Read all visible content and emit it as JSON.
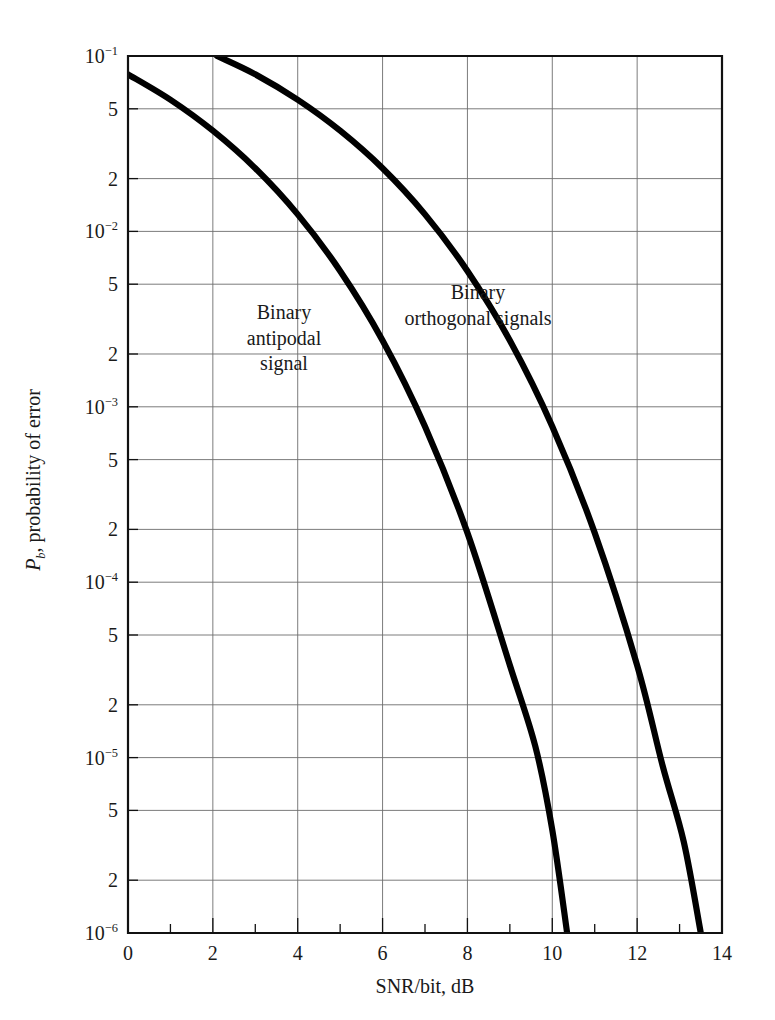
{
  "figure": {
    "background": "#ffffff",
    "curve_color": "#000000",
    "grid_color": "#6d6d6d",
    "axis_color": "#111111"
  },
  "axes": {
    "x": {
      "title": "SNR/bit, dB",
      "min": 0,
      "max": 14,
      "major_ticks": [
        0,
        2,
        4,
        6,
        8,
        10,
        12,
        14
      ],
      "major_tick_labels": [
        "0",
        "2",
        "4",
        "6",
        "8",
        "10",
        "12",
        "14"
      ],
      "minor_ticks": [
        1,
        3,
        5,
        7,
        9,
        11,
        13
      ]
    },
    "y": {
      "title_prefix": "P",
      "title_sub": "b",
      "title_rest": ", probability of error",
      "title_plain": "Pb, probability of error",
      "scale": "log",
      "min": 1e-06,
      "max": 0.1,
      "tick_values": [
        0.1,
        0.05,
        0.02,
        0.01,
        0.005,
        0.002,
        0.001,
        0.0005,
        0.0002,
        0.0001,
        5e-05,
        2e-05,
        1e-05,
        5e-06,
        2e-06,
        1e-06
      ],
      "tick_labels": [
        {
          "mantissa": "10",
          "exponent": "-1"
        },
        {
          "mantissa": "5",
          "exponent": ""
        },
        {
          "mantissa": "2",
          "exponent": ""
        },
        {
          "mantissa": "10",
          "exponent": "-2"
        },
        {
          "mantissa": "5",
          "exponent": ""
        },
        {
          "mantissa": "2",
          "exponent": ""
        },
        {
          "mantissa": "10",
          "exponent": "-3"
        },
        {
          "mantissa": "5",
          "exponent": ""
        },
        {
          "mantissa": "2",
          "exponent": ""
        },
        {
          "mantissa": "10",
          "exponent": "-4"
        },
        {
          "mantissa": "5",
          "exponent": ""
        },
        {
          "mantissa": "2",
          "exponent": ""
        },
        {
          "mantissa": "10",
          "exponent": "-5"
        },
        {
          "mantissa": "5",
          "exponent": ""
        },
        {
          "mantissa": "2",
          "exponent": ""
        },
        {
          "mantissa": "10",
          "exponent": "-6"
        }
      ]
    }
  },
  "annotations": [
    {
      "name": "binary-antipodal-label",
      "lines": [
        "Binary",
        "antipodal",
        "signal"
      ],
      "x_px": 284,
      "y_px": 300
    },
    {
      "name": "binary-orthogonal-label",
      "lines": [
        "Binary",
        "orthogonal signals"
      ],
      "x_px": 478,
      "y_px": 280
    }
  ],
  "chart_data": {
    "type": "line",
    "title": "",
    "xlabel": "SNR/bit, dB",
    "ylabel": "Pb, probability of error",
    "xlim": [
      0,
      14
    ],
    "ylim": [
      1e-06,
      0.1
    ],
    "yscale": "log",
    "grid": true,
    "legend": "inline-annotations",
    "series": [
      {
        "name": "Binary antipodal signal",
        "x": [
          0,
          1,
          2,
          3,
          4,
          5,
          6,
          7,
          8,
          9,
          9.6,
          10.0,
          10.35
        ],
        "y": [
          0.0786,
          0.0563,
          0.0375,
          0.0229,
          0.0125,
          0.00595,
          0.00239,
          0.000773,
          0.000191,
          3.36e-05,
          1.16e-05,
          3.87e-06,
          1e-06
        ]
      },
      {
        "name": "Binary orthogonal signals",
        "x": [
          2.1,
          3,
          4,
          5,
          6,
          7,
          8,
          9,
          10,
          11,
          12,
          12.6,
          13.1,
          13.5
        ],
        "y": [
          0.1,
          0.0786,
          0.0563,
          0.0375,
          0.0229,
          0.0125,
          0.00595,
          0.00239,
          0.000773,
          0.000191,
          3.36e-05,
          9e-06,
          3.3e-06,
          1e-06
        ]
      }
    ]
  }
}
